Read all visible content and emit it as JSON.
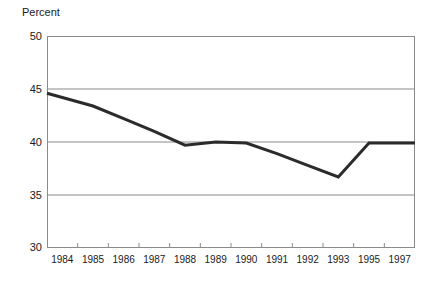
{
  "chart_data": {
    "type": "line",
    "title": "",
    "ylabel": "Percent",
    "xlabel": "",
    "ylim": [
      30,
      50
    ],
    "y_ticks": [
      30,
      35,
      40,
      45,
      50
    ],
    "grid": true,
    "grid_axis": "y",
    "legend": "none",
    "categories": [
      "1984",
      "1985",
      "1986",
      "1987",
      "1988",
      "1989",
      "1990",
      "1991",
      "1992",
      "1993",
      "1995",
      "1997"
    ],
    "values": [
      44.6,
      43.4,
      42.2,
      41.0,
      39.7,
      40.0,
      39.9,
      38.9,
      37.8,
      36.7,
      39.9,
      39.9
    ],
    "series": [
      {
        "name": "Percent",
        "color": "#2b2b2b",
        "values": [
          44.6,
          43.4,
          42.2,
          41.0,
          39.7,
          40.0,
          39.9,
          38.9,
          37.8,
          36.7,
          39.9,
          39.9
        ]
      }
    ],
    "annotations": []
  },
  "axes": {
    "y_title": "Percent",
    "y_tick_labels": [
      "50",
      "45",
      "40",
      "35",
      "30"
    ],
    "x_tick_labels": [
      "1984",
      "1985",
      "1986",
      "1987",
      "1988",
      "1989",
      "1990",
      "1991",
      "1992",
      "1993",
      "1995",
      "1997"
    ]
  },
  "style": {
    "line_color": "#2b2b2b",
    "grid_color": "#8a8a8a",
    "frame_color": "#8a8a8a",
    "background": "#ffffff",
    "text_color": "#1a1a1a"
  }
}
